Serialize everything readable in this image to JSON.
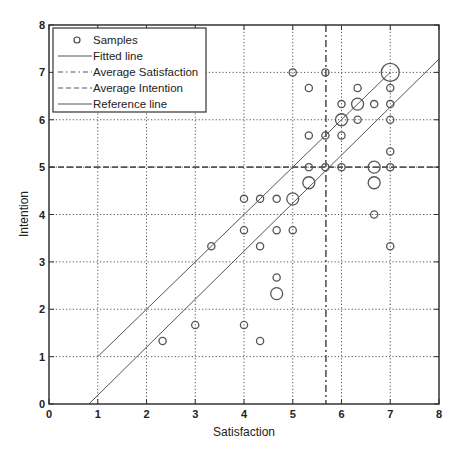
{
  "chart_data": {
    "type": "scatter",
    "title": "",
    "xlabel": "Satisfaction",
    "ylabel": "Intention",
    "xlim": [
      0,
      8
    ],
    "ylim": [
      0,
      8
    ],
    "xticks": [
      0,
      1,
      2,
      3,
      4,
      5,
      6,
      7,
      8
    ],
    "yticks": [
      0,
      1,
      2,
      3,
      4,
      5,
      6,
      7,
      8
    ],
    "grid": true,
    "legend_position": "upper-left",
    "legend": [
      "Samples",
      "Fitted line",
      "Average Satisfaction",
      "Average Intention",
      "Reference line"
    ],
    "samples": [
      {
        "x": 5.0,
        "y": 7.0,
        "size": 1
      },
      {
        "x": 5.67,
        "y": 7.0,
        "size": 1
      },
      {
        "x": 7.0,
        "y": 7.0,
        "size": 3
      },
      {
        "x": 5.33,
        "y": 6.67,
        "size": 1
      },
      {
        "x": 6.33,
        "y": 6.67,
        "size": 1
      },
      {
        "x": 7.0,
        "y": 6.67,
        "size": 1
      },
      {
        "x": 6.0,
        "y": 6.33,
        "size": 1
      },
      {
        "x": 6.33,
        "y": 6.33,
        "size": 2
      },
      {
        "x": 6.67,
        "y": 6.33,
        "size": 1
      },
      {
        "x": 7.0,
        "y": 6.33,
        "size": 1
      },
      {
        "x": 6.0,
        "y": 6.0,
        "size": 2
      },
      {
        "x": 6.33,
        "y": 6.0,
        "size": 1
      },
      {
        "x": 7.0,
        "y": 6.0,
        "size": 1
      },
      {
        "x": 5.33,
        "y": 5.67,
        "size": 1
      },
      {
        "x": 5.67,
        "y": 5.67,
        "size": 1
      },
      {
        "x": 6.0,
        "y": 5.67,
        "size": 1
      },
      {
        "x": 7.0,
        "y": 5.33,
        "size": 1
      },
      {
        "x": 5.33,
        "y": 5.0,
        "size": 1
      },
      {
        "x": 5.67,
        "y": 5.0,
        "size": 1
      },
      {
        "x": 6.0,
        "y": 5.0,
        "size": 1
      },
      {
        "x": 6.67,
        "y": 5.0,
        "size": 2
      },
      {
        "x": 7.0,
        "y": 5.0,
        "size": 1
      },
      {
        "x": 5.33,
        "y": 4.67,
        "size": 2
      },
      {
        "x": 6.67,
        "y": 4.67,
        "size": 2
      },
      {
        "x": 4.0,
        "y": 4.33,
        "size": 1
      },
      {
        "x": 4.33,
        "y": 4.33,
        "size": 1
      },
      {
        "x": 4.67,
        "y": 4.33,
        "size": 1
      },
      {
        "x": 5.0,
        "y": 4.33,
        "size": 2
      },
      {
        "x": 6.67,
        "y": 4.0,
        "size": 1
      },
      {
        "x": 4.0,
        "y": 3.67,
        "size": 1
      },
      {
        "x": 4.67,
        "y": 3.67,
        "size": 1
      },
      {
        "x": 5.0,
        "y": 3.67,
        "size": 1
      },
      {
        "x": 3.33,
        "y": 3.33,
        "size": 1
      },
      {
        "x": 4.33,
        "y": 3.33,
        "size": 1
      },
      {
        "x": 7.0,
        "y": 3.33,
        "size": 1
      },
      {
        "x": 4.67,
        "y": 2.67,
        "size": 1
      },
      {
        "x": 4.67,
        "y": 2.33,
        "size": 2
      },
      {
        "x": 3.0,
        "y": 1.67,
        "size": 1
      },
      {
        "x": 4.0,
        "y": 1.67,
        "size": 1
      },
      {
        "x": 2.33,
        "y": 1.33,
        "size": 1
      },
      {
        "x": 4.33,
        "y": 1.33,
        "size": 1
      }
    ],
    "fitted_line": {
      "slope": 1.014,
      "intercept": -0.83,
      "x_range": [
        0.82,
        8.0
      ]
    },
    "reference_line": {
      "slope": 1.0,
      "intercept": 0.0,
      "x_range": [
        1.0,
        7.0
      ]
    },
    "average_satisfaction": 5.68,
    "average_intention": 5.0
  },
  "colors": {
    "axis": "#333333",
    "grid": "#555555",
    "marker": "#555555",
    "line": "#555555",
    "background": "#ffffff"
  }
}
